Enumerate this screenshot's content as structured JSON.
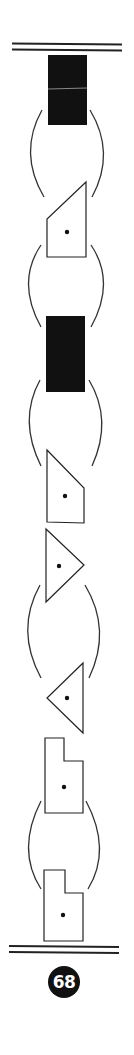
{
  "figure": {
    "type": "puzzle-sequence",
    "colors": {
      "ink": "#111111",
      "paper": "#ffffff",
      "divider": "#222222",
      "arc": "#333333"
    },
    "page_number": "68",
    "sequence": [
      {
        "kind": "filled-rectangle",
        "label": "black rectangle with thin horizontal line"
      },
      {
        "kind": "grouping-arcs",
        "label": "parentheses pair"
      },
      {
        "kind": "trapezoid-dot",
        "label": "trapezoid slanted top-left with center dot"
      },
      {
        "kind": "grouping-arcs",
        "label": "parentheses pair"
      },
      {
        "kind": "filled-rectangle",
        "label": "black rectangle"
      },
      {
        "kind": "grouping-arcs",
        "label": "parentheses pair"
      },
      {
        "kind": "trapezoid-dot",
        "label": "trapezoid slanted top-right with center dot"
      },
      {
        "kind": "triangle-dot",
        "label": "right-pointing triangle with dot"
      },
      {
        "kind": "grouping-arcs",
        "label": "parentheses pair"
      },
      {
        "kind": "triangle-dot",
        "label": "left-pointing triangle with dot"
      },
      {
        "kind": "step-shape-dot",
        "label": "step shape with dot"
      },
      {
        "kind": "grouping-arcs",
        "label": "parentheses pair"
      },
      {
        "kind": "step-shape-dot",
        "label": "step shape with dot"
      }
    ]
  }
}
